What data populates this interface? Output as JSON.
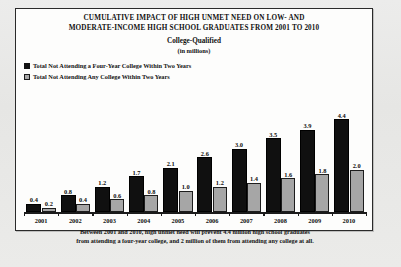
{
  "chart_data": {
    "type": "bar",
    "title_lines": [
      "CUMULATIVE  IMPACT OF HIGH UNMET NEED ON LOW- AND",
      "MODERATE-INCOME HIGH SCHOOL GRADUATES FROM 2001 TO 2010"
    ],
    "subtitle": "College-Qualified",
    "units": "(in millions)",
    "categories": [
      "2001",
      "2002",
      "2003",
      "2004",
      "2005",
      "2006",
      "2007",
      "2008",
      "2009",
      "2010"
    ],
    "series": [
      {
        "name": "Total Not Attending a Four-Year College Within Two Years",
        "color": "#101010",
        "values": [
          0.4,
          0.8,
          1.2,
          1.7,
          2.1,
          2.6,
          3.0,
          3.5,
          3.9,
          4.4
        ]
      },
      {
        "name": "Total Not Attending Any College Within Two Years",
        "color": "#a6a6a6",
        "values": [
          0.2,
          0.4,
          0.6,
          0.8,
          1.0,
          1.2,
          1.4,
          1.6,
          1.8,
          2.0
        ]
      }
    ],
    "xlabel": "",
    "ylabel": "",
    "ylim": [
      0,
      4.8
    ],
    "grid": false,
    "legend_position": "top-left",
    "footer_lines": [
      "Between 2001 and 2010, high unmet need will prevent 4.4 million high school graduates",
      "from attending a four-year college, and 2 million of them from attending any college at all."
    ]
  }
}
